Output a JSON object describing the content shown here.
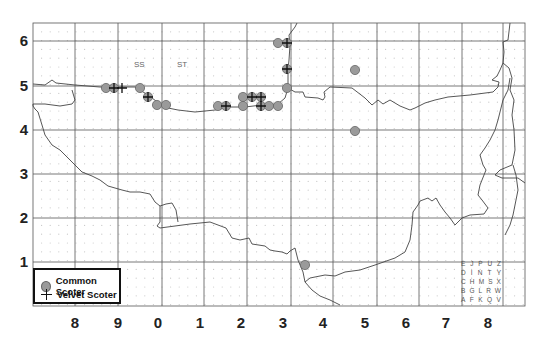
{
  "map": {
    "y_axis_labels": [
      "6",
      "5",
      "4",
      "3",
      "2",
      "1"
    ],
    "x_axis_labels": [
      "8",
      "9",
      "0",
      "1",
      "2",
      "3",
      "4",
      "5",
      "6",
      "7",
      "8"
    ],
    "square_labels": [
      {
        "text": "SS",
        "x": 140,
        "y": 65
      },
      {
        "text": "ST",
        "x": 182,
        "y": 65
      }
    ],
    "colors": {
      "grid": "#555555",
      "coast": "#444444",
      "common_scoter_fill": "#9a9a9a",
      "common_scoter_stroke": "#666666",
      "velvet_scoter": "#111111",
      "dot_grid": "#c8c8c8"
    }
  },
  "legend": {
    "items": [
      {
        "label": "Common Scoter",
        "icon": "grey-circle-icon"
      },
      {
        "label": "Velvet Scoter",
        "icon": "cross-icon"
      }
    ]
  },
  "tetrad_key": {
    "rows": [
      [
        "E",
        "J",
        "P",
        "U",
        "Z"
      ],
      [
        "D",
        "I",
        "N",
        "T",
        "Y"
      ],
      [
        "C",
        "H",
        "M",
        "S",
        "X"
      ],
      [
        "B",
        "G",
        "L",
        "R",
        "W"
      ],
      [
        "A",
        "F",
        "K",
        "Q",
        "V"
      ]
    ]
  },
  "records": {
    "common_scoter": [
      [
        106,
        88
      ],
      [
        114,
        88
      ],
      [
        140,
        88
      ],
      [
        148,
        97
      ],
      [
        157,
        105
      ],
      [
        166,
        105
      ],
      [
        218,
        106
      ],
      [
        226,
        106
      ],
      [
        243,
        97
      ],
      [
        252,
        97
      ],
      [
        261,
        97
      ],
      [
        243,
        106
      ],
      [
        261,
        106
      ],
      [
        269,
        106
      ],
      [
        278,
        106
      ],
      [
        287,
        88
      ],
      [
        287,
        69
      ],
      [
        278,
        43
      ],
      [
        287,
        43
      ],
      [
        355,
        70
      ],
      [
        355,
        131
      ],
      [
        305,
        265
      ]
    ],
    "velvet_scoter": [
      [
        114,
        88
      ],
      [
        122,
        88
      ],
      [
        148,
        97
      ],
      [
        226,
        106
      ],
      [
        252,
        97
      ],
      [
        261,
        97
      ],
      [
        261,
        106
      ],
      [
        287,
        69
      ],
      [
        287,
        43
      ]
    ]
  }
}
